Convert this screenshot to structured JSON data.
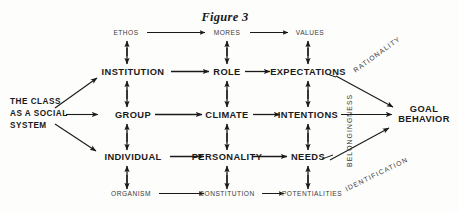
{
  "figure": {
    "title": "Figure 3",
    "background_color": "#fdfdfc",
    "ink_color": "#1a1a1a"
  },
  "source": {
    "line1": "THE CLASS",
    "line2": "AS A SOCIAL",
    "line3": "SYSTEM"
  },
  "terminal": {
    "line1": "GOAL",
    "line2": "BEHAVIOR"
  },
  "rows": {
    "top": {
      "nodes": [
        {
          "label": "ETHOS",
          "x": 126,
          "y": 33
        },
        {
          "label": "MORES",
          "x": 227,
          "y": 33
        },
        {
          "label": "VALUES",
          "x": 310,
          "y": 33
        }
      ]
    },
    "institution": {
      "nodes": [
        {
          "label": "INSTITUTION",
          "x": 133,
          "y": 72
        },
        {
          "label": "ROLE",
          "x": 227,
          "y": 72
        },
        {
          "label": "EXPECTATIONS",
          "x": 308,
          "y": 72
        }
      ]
    },
    "group": {
      "nodes": [
        {
          "label": "GROUP",
          "x": 133,
          "y": 115
        },
        {
          "label": "CLIMATE",
          "x": 227,
          "y": 115
        },
        {
          "label": "INTENTIONS",
          "x": 308,
          "y": 115
        }
      ]
    },
    "individual": {
      "nodes": [
        {
          "label": "INDIVIDUAL",
          "x": 133,
          "y": 157
        },
        {
          "label": "PERSONALITY",
          "x": 227,
          "y": 157
        },
        {
          "label": "NEEDS",
          "x": 308,
          "y": 157
        }
      ]
    },
    "bottom": {
      "nodes": [
        {
          "label": "ORGANISM",
          "x": 131,
          "y": 194
        },
        {
          "label": "CONSTITUTION",
          "x": 227,
          "y": 194
        },
        {
          "label": "POTENTIALITIES",
          "x": 312,
          "y": 194
        }
      ]
    }
  },
  "diagonal_labels": {
    "rationality": "RATIONALITY",
    "belongingness": "BELONGINGNESS",
    "identification": "IDENTIFICATION"
  }
}
